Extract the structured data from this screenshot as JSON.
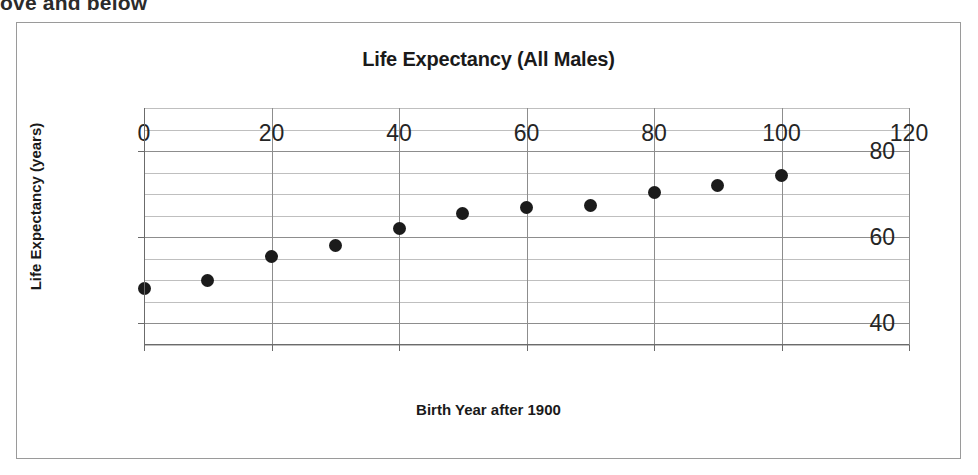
{
  "page": {
    "top_text_fragment": "ove and below"
  },
  "chart_data": {
    "type": "scatter",
    "title": "Life Expectancy (All Males)",
    "xlabel": "Birth Year after 1900",
    "ylabel": "Life Expectancy (years)",
    "xlim": [
      0,
      120
    ],
    "ylim": [
      35,
      90
    ],
    "xticks": [
      0,
      20,
      40,
      60,
      80,
      100,
      120
    ],
    "xtick_labels": [
      "0",
      "20",
      "40",
      "60",
      "80",
      "100",
      "120"
    ],
    "yticks": [
      40,
      60,
      80
    ],
    "ytick_labels": [
      "40",
      "60",
      "80"
    ],
    "y_minor_step": 5,
    "grid": true,
    "legend": false,
    "marker_color": "#1b1b1b",
    "series": [
      {
        "name": "All Males",
        "points": [
          {
            "x": 0,
            "y": 48
          },
          {
            "x": 10,
            "y": 50
          },
          {
            "x": 20,
            "y": 55.5
          },
          {
            "x": 30,
            "y": 58
          },
          {
            "x": 40,
            "y": 62
          },
          {
            "x": 50,
            "y": 65.5
          },
          {
            "x": 60,
            "y": 67
          },
          {
            "x": 70,
            "y": 67.3
          },
          {
            "x": 80,
            "y": 70.5
          },
          {
            "x": 90,
            "y": 72
          },
          {
            "x": 100,
            "y": 74.3
          }
        ]
      }
    ]
  }
}
